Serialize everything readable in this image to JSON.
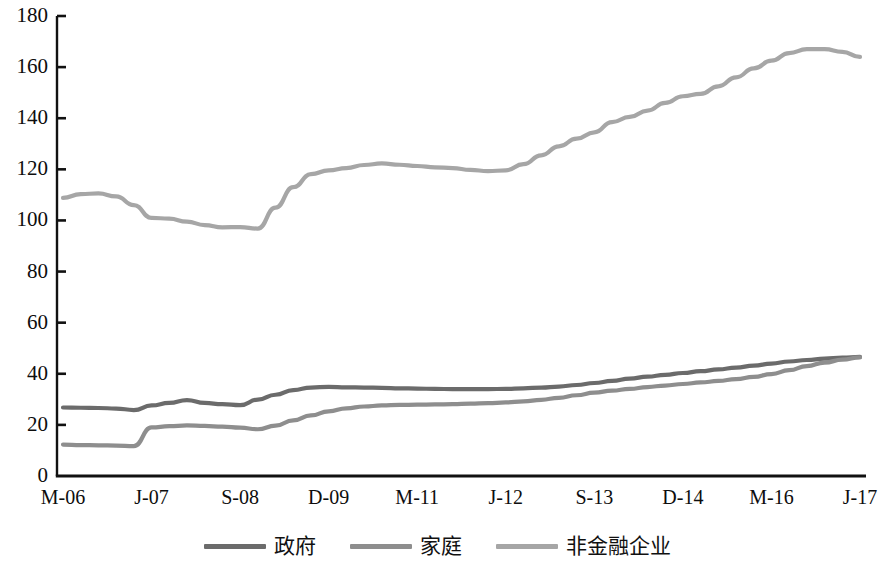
{
  "chart_data": {
    "type": "line",
    "title": "",
    "xlabel": "",
    "ylabel": "",
    "ylim": [
      0,
      180
    ],
    "yticks": [
      0,
      20,
      40,
      60,
      80,
      100,
      120,
      140,
      160,
      180
    ],
    "grid": false,
    "legend_position": "bottom",
    "x_tick_labels": [
      "M-06",
      "J-07",
      "S-08",
      "D-09",
      "M-11",
      "J-12",
      "S-13",
      "D-14",
      "M-16",
      "J-17"
    ],
    "x_tick_indices": [
      0,
      5,
      10,
      15,
      20,
      25,
      30,
      35,
      40,
      45
    ],
    "x": [
      "M-06",
      "J-06",
      "S-06",
      "D-06",
      "M-07",
      "J-07",
      "S-07",
      "D-07",
      "M-08",
      "J-08",
      "S-08",
      "D-08",
      "M-09",
      "J-09",
      "S-09",
      "D-09",
      "M-10",
      "J-10",
      "S-10",
      "D-10",
      "M-11",
      "J-11",
      "S-11",
      "D-11",
      "M-12",
      "J-12",
      "S-12",
      "D-12",
      "M-13",
      "J-13",
      "S-13",
      "D-13",
      "M-14",
      "J-14",
      "S-14",
      "D-14",
      "M-15",
      "J-15",
      "S-15",
      "D-15",
      "M-16",
      "J-16",
      "S-16",
      "D-16",
      "M-17",
      "J-17"
    ],
    "series": [
      {
        "name": "政府",
        "color": "#6b6b6b",
        "values": [
          26.8,
          26.7,
          26.6,
          26.4,
          25.8,
          27.6,
          28.6,
          29.7,
          28.6,
          28.1,
          27.7,
          29.9,
          31.8,
          33.6,
          34.6,
          34.9,
          34.7,
          34.6,
          34.5,
          34.3,
          34.2,
          34.1,
          34.0,
          34.0,
          34.0,
          34.1,
          34.3,
          34.6,
          35.0,
          35.6,
          36.4,
          37.2,
          38.1,
          38.9,
          39.6,
          40.3,
          41.0,
          41.7,
          42.4,
          43.2,
          44.0,
          44.8,
          45.4,
          45.9,
          46.3,
          46.6
        ]
      },
      {
        "name": "家庭",
        "color": "#8e8e8e",
        "values": [
          12.3,
          12.1,
          12.0,
          11.9,
          11.7,
          19.0,
          19.5,
          19.8,
          19.6,
          19.3,
          18.9,
          18.3,
          19.7,
          21.8,
          23.7,
          25.3,
          26.5,
          27.2,
          27.6,
          27.8,
          27.9,
          28.0,
          28.1,
          28.3,
          28.5,
          28.8,
          29.2,
          29.8,
          30.6,
          31.6,
          32.6,
          33.4,
          34.1,
          34.8,
          35.4,
          36.0,
          36.6,
          37.2,
          37.9,
          38.8,
          39.9,
          41.4,
          43.0,
          44.4,
          45.5,
          46.4
        ]
      },
      {
        "name": "非金融企业",
        "color": "#a6a6a6",
        "values": [
          108.8,
          110.3,
          110.6,
          109.4,
          106.0,
          101.0,
          100.7,
          99.5,
          98.2,
          97.3,
          97.4,
          96.8,
          105.0,
          113.0,
          118.1,
          119.6,
          120.5,
          121.7,
          122.3,
          121.8,
          121.3,
          120.8,
          120.5,
          119.8,
          119.3,
          119.6,
          122.0,
          125.5,
          129.0,
          132.0,
          134.5,
          138.5,
          140.5,
          143.0,
          146.0,
          148.6,
          149.5,
          152.5,
          156.0,
          159.5,
          162.5,
          165.5,
          167.0,
          167.0,
          166.0,
          164.0
        ]
      }
    ]
  },
  "axis": {
    "color": "#111111",
    "tick_color": "#111111"
  }
}
